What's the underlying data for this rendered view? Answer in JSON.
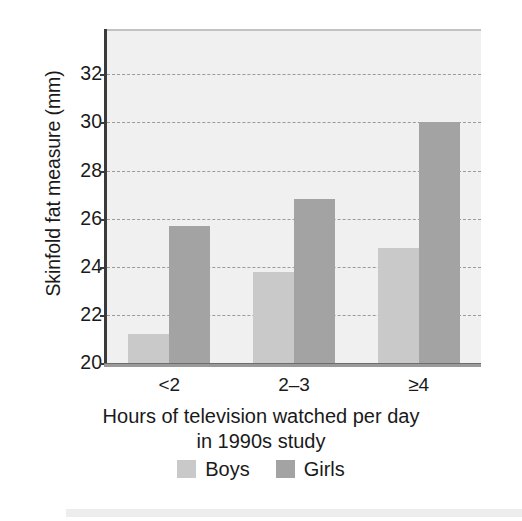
{
  "chart_data": {
    "type": "bar",
    "title": "",
    "subtitle": "",
    "xlabel": "Hours of television watched per day in 1990s study",
    "xlabel_line1": "Hours of television watched per day",
    "xlabel_line2": "in 1990s study",
    "ylabel": "Skinfold fat measure (mm)",
    "categories": [
      "<2",
      "2–3",
      "≥4"
    ],
    "series": [
      {
        "name": "Boys",
        "color": "#c9c9c9",
        "values": [
          21.2,
          23.8,
          24.8
        ]
      },
      {
        "name": "Girls",
        "color": "#a3a3a3",
        "values": [
          25.7,
          26.8,
          30.0
        ]
      }
    ],
    "ylim": [
      20,
      33.8
    ],
    "yticks": [
      20,
      22,
      24,
      26,
      28,
      30,
      32
    ],
    "ytick_labels": [
      "20",
      "22",
      "24",
      "26",
      "28",
      "30",
      "32"
    ],
    "grid": true,
    "gridline_style": "dashed",
    "legend_position": "bottom",
    "plot_background": "#f0f0f0",
    "axis_color": "#3a3a3a"
  },
  "legend": {
    "items": [
      {
        "label": "Boys",
        "color": "#c9c9c9"
      },
      {
        "label": "Girls",
        "color": "#a3a3a3"
      }
    ]
  }
}
